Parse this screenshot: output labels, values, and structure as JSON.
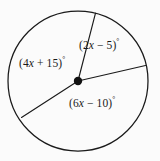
{
  "figure": {
    "type": "circle-with-central-angles",
    "background_color": "#fbfbfb",
    "stroke_color": "#1a1a1a",
    "circle": {
      "cx": 78,
      "cy": 81,
      "r": 70
    },
    "center_point": {
      "cx": 78,
      "cy": 81,
      "r": 4.2,
      "fill": "#111111",
      "label": "center-dot"
    },
    "radii": [
      {
        "name": "radius-upper",
        "x1": 78,
        "y1": 81,
        "x2": 95.5,
        "y2": 13.2
      },
      {
        "name": "radius-right",
        "x1": 78,
        "y1": 81,
        "x2": 145.5,
        "y2": 65.5
      },
      {
        "name": "radius-lower-left",
        "x1": 78,
        "y1": 81,
        "x2": 21.5,
        "y2": 117.5
      }
    ],
    "labels": {
      "left_sector": {
        "open_paren": "(",
        "coef": "4",
        "var": "x",
        "op": " + ",
        "const": "15",
        "close_paren": ")",
        "degree": "°",
        "full_text": "(4x + 15)°"
      },
      "upper_right_sector": {
        "open_paren": "(",
        "coef": "2",
        "var": "x",
        "op": " − ",
        "const": "5",
        "close_paren": ")",
        "degree": "°",
        "full_text": "(2x − 5)°"
      },
      "lower_right_sector": {
        "open_paren": "(",
        "coef": "6",
        "var": "x",
        "op": " − ",
        "const": "10",
        "close_paren": ")",
        "degree": "°",
        "full_text": "(6x − 10)°"
      }
    }
  }
}
